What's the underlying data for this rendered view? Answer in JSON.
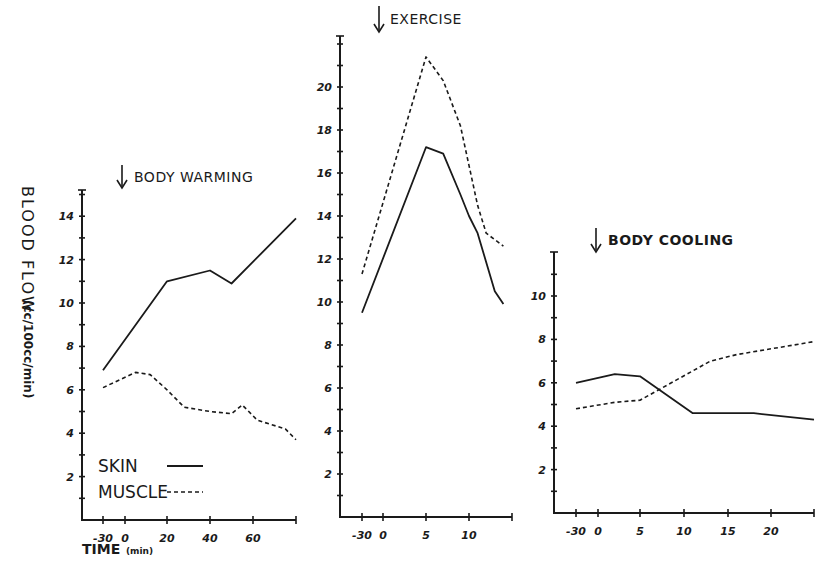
{
  "figure": {
    "y_axis_label": "BLOOD FLOW",
    "y_axis_unit": "(cc/100cc/min)",
    "x_axis_label": "TIME",
    "x_axis_unit": "(min)",
    "legend": [
      {
        "label": "SKIN",
        "style": "solid"
      },
      {
        "label": "MUSCLE",
        "style": "dashed"
      }
    ]
  },
  "chart_data": [
    {
      "type": "line",
      "title": "BODY WARMING",
      "xlabel": "TIME (min)",
      "ylabel": "BLOOD FLOW (cc/100cc/min)",
      "x_ticks": [
        "-30",
        "0",
        "20",
        "40",
        "60"
      ],
      "y_ticks": [
        "2",
        "4",
        "6",
        "8",
        "10",
        "12",
        "14"
      ],
      "ylim": [
        0,
        15
      ],
      "series": [
        {
          "name": "SKIN",
          "x": [
            -30,
            20,
            40,
            50,
            80
          ],
          "values": [
            6.9,
            11.0,
            11.5,
            10.9,
            13.9
          ]
        },
        {
          "name": "MUSCLE",
          "x": [
            -30,
            5,
            12,
            20,
            28,
            40,
            50,
            55,
            62,
            75,
            80
          ],
          "values": [
            6.1,
            6.8,
            6.7,
            6.0,
            5.2,
            5.0,
            4.9,
            5.3,
            4.6,
            4.2,
            3.7
          ]
        }
      ]
    },
    {
      "type": "line",
      "title": "EXERCISE",
      "xlabel": "TIME (min)",
      "ylabel": "BLOOD FLOW (cc/100cc/min)",
      "x_ticks": [
        "-30",
        "0",
        "5",
        "10"
      ],
      "y_ticks": [
        "2",
        "4",
        "6",
        "8",
        "10",
        "12",
        "14",
        "16",
        "18",
        "20"
      ],
      "ylim": [
        0,
        22
      ],
      "series": [
        {
          "name": "SKIN",
          "x": [
            -30,
            5,
            7,
            9,
            10,
            11,
            13,
            14
          ],
          "values": [
            9.5,
            17.2,
            16.9,
            15.0,
            14.0,
            13.2,
            10.5,
            9.9
          ]
        },
        {
          "name": "MUSCLE",
          "x": [
            -30,
            5,
            7,
            9,
            11,
            12,
            14
          ],
          "values": [
            11.3,
            21.4,
            20.3,
            18.2,
            14.5,
            13.2,
            12.6
          ]
        }
      ]
    },
    {
      "type": "line",
      "title": "BODY COOLING",
      "xlabel": "TIME (min)",
      "ylabel": "BLOOD FLOW (cc/100cc/min)",
      "x_ticks": [
        "-30",
        "0",
        "5",
        "10",
        "15",
        "20"
      ],
      "y_ticks": [
        "2",
        "4",
        "6",
        "8",
        "10"
      ],
      "ylim": [
        0,
        12
      ],
      "series": [
        {
          "name": "SKIN",
          "x": [
            -30,
            2,
            5,
            11,
            18,
            25
          ],
          "values": [
            6.0,
            6.4,
            6.3,
            4.6,
            4.6,
            4.3
          ]
        },
        {
          "name": "MUSCLE",
          "x": [
            -30,
            2,
            5,
            13,
            16,
            25
          ],
          "values": [
            4.8,
            5.1,
            5.2,
            7.0,
            7.3,
            7.9
          ]
        }
      ]
    }
  ]
}
